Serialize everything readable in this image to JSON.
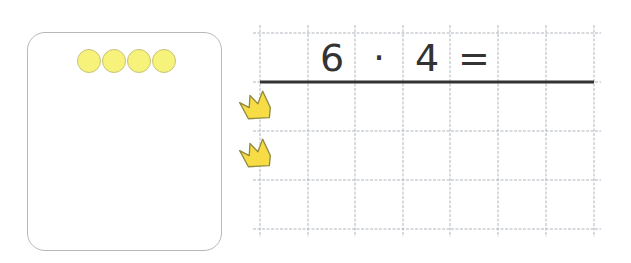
{
  "counters": {
    "count": 4,
    "color": "#f6f27a",
    "border_color": "#c9c27a"
  },
  "equation": {
    "cells": [
      "6",
      "·",
      "4",
      "="
    ],
    "answer": ""
  },
  "grid": {
    "columns": 7,
    "rows": 4,
    "line_color": "#b0b6bd",
    "underline_color": "#333333"
  },
  "crowns": {
    "count": 2,
    "icon": "crown-icon",
    "color": "#f7dc45",
    "outline_color": "#8f8a3c"
  }
}
